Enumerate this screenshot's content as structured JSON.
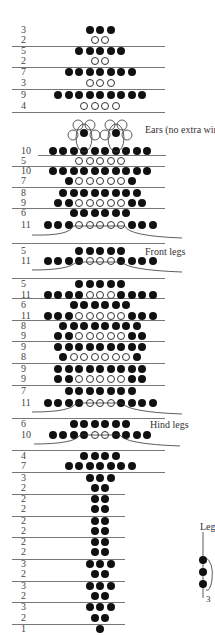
{
  "diagram": {
    "bead_spacing": 10.5,
    "center_x": 100,
    "rows": [
      {
        "label": "3",
        "y": 30,
        "pattern": "FFF"
      },
      {
        "label": "2",
        "y": 40,
        "pattern": "OO"
      },
      {
        "label": "5",
        "y": 51,
        "pattern": "FFFFF"
      },
      {
        "label": "2",
        "y": 61,
        "pattern": "OO"
      },
      {
        "label": "7",
        "y": 72,
        "pattern": "FFFFFFF"
      },
      {
        "label": "3",
        "y": 83,
        "pattern": "OOO"
      },
      {
        "label": "9",
        "y": 95,
        "pattern": "FFFFFFFFF"
      },
      {
        "label": "4",
        "y": 106,
        "pattern": "OOOO"
      },
      {
        "label": "10",
        "y": 151,
        "pattern": "FFFFFFFFFF"
      },
      {
        "label": "5",
        "y": 161,
        "pattern": "OOOOO"
      },
      {
        "label": "10",
        "y": 171,
        "pattern": "FFFFFFFFFF"
      },
      {
        "label": "7",
        "y": 181,
        "pattern": "FOOOOOF"
      },
      {
        "label": "8",
        "y": 193,
        "pattern": "FFFFFFFF"
      },
      {
        "label": "9",
        "y": 203,
        "pattern": "FFOOOOOFF"
      },
      {
        "label": "6",
        "y": 213,
        "pattern": "FFFFFF"
      },
      {
        "label": "11",
        "y": 225,
        "pattern": "FFFOOOOOFFF"
      },
      {
        "label": "5",
        "y": 251,
        "pattern": "FFFFF"
      },
      {
        "label": "11",
        "y": 261,
        "pattern": "FFFFOOOFFFF"
      },
      {
        "label": "5",
        "y": 284,
        "pattern": "FFFFF"
      },
      {
        "label": "11",
        "y": 295,
        "pattern": "FFFFOOOFFFF"
      },
      {
        "label": "6",
        "y": 305,
        "pattern": "FFFFFF"
      },
      {
        "label": "11",
        "y": 316,
        "pattern": "FFFOOOOOFFF"
      },
      {
        "label": "8",
        "y": 326,
        "pattern": "FFFFFFFF"
      },
      {
        "label": "9",
        "y": 336,
        "pattern": "FFOOOOOFF"
      },
      {
        "label": "9",
        "y": 347,
        "pattern": "FFFFFFFFF"
      },
      {
        "label": "8",
        "y": 357,
        "pattern": "FOOOOOOF"
      },
      {
        "label": "9",
        "y": 369,
        "pattern": "FFFFFFFFF"
      },
      {
        "label": "9",
        "y": 379,
        "pattern": "FFOOOOOFF"
      },
      {
        "label": "7",
        "y": 391,
        "pattern": "FFFFFFF"
      },
      {
        "label": "11",
        "y": 403,
        "pattern": "FFFFOOOFFFF"
      },
      {
        "label": "6",
        "y": 424,
        "pattern": "FFFFFF"
      },
      {
        "label": "10",
        "y": 435,
        "pattern": "FFFFOOFFFF"
      },
      {
        "label": "4",
        "y": 456,
        "pattern": "FFFF"
      },
      {
        "label": "7",
        "y": 466,
        "pattern": "FFFFFFF"
      },
      {
        "label": "3",
        "y": 478,
        "pattern": "FFF"
      },
      {
        "label": "2",
        "y": 488,
        "pattern": "FF"
      },
      {
        "label": "2",
        "y": 499,
        "pattern": "FF"
      },
      {
        "label": "2",
        "y": 509,
        "pattern": "FF"
      },
      {
        "label": "2",
        "y": 521,
        "pattern": "FF"
      },
      {
        "label": "2",
        "y": 531,
        "pattern": "FF"
      },
      {
        "label": "2",
        "y": 542,
        "pattern": "FF"
      },
      {
        "label": "2",
        "y": 552,
        "pattern": "FF"
      },
      {
        "label": "3",
        "y": 564,
        "pattern": "FFF"
      },
      {
        "label": "2",
        "y": 574,
        "pattern": "FF"
      },
      {
        "label": "3",
        "y": 586,
        "pattern": "FFF"
      },
      {
        "label": "2",
        "y": 596,
        "pattern": "FF"
      },
      {
        "label": "3",
        "y": 607,
        "pattern": "FFF"
      },
      {
        "label": "2",
        "y": 618,
        "pattern": "FF"
      },
      {
        "label": "1",
        "y": 629,
        "pattern": "F"
      }
    ],
    "separators": [
      {
        "y": 46,
        "x": 12,
        "w": 153
      },
      {
        "y": 67,
        "x": 12,
        "w": 153
      },
      {
        "y": 89,
        "x": 12,
        "w": 153
      },
      {
        "y": 112,
        "x": 12,
        "w": 153
      },
      {
        "y": 155,
        "x": 38,
        "w": 128
      },
      {
        "y": 166,
        "x": 12,
        "w": 153
      },
      {
        "y": 187,
        "x": 12,
        "w": 153
      },
      {
        "y": 208,
        "x": 12,
        "w": 153
      },
      {
        "y": 243,
        "x": 12,
        "w": 153
      },
      {
        "y": 278,
        "x": 12,
        "w": 153
      },
      {
        "y": 298,
        "x": 12,
        "w": 153
      },
      {
        "y": 320,
        "x": 12,
        "w": 153
      },
      {
        "y": 341,
        "x": 12,
        "w": 153
      },
      {
        "y": 363,
        "x": 12,
        "w": 153
      },
      {
        "y": 385,
        "x": 12,
        "w": 153
      },
      {
        "y": 418,
        "x": 12,
        "w": 153
      },
      {
        "y": 450,
        "x": 12,
        "w": 153
      },
      {
        "y": 472,
        "x": 12,
        "w": 153
      },
      {
        "y": 494,
        "x": 12,
        "w": 113
      },
      {
        "y": 516,
        "x": 12,
        "w": 113
      },
      {
        "y": 537,
        "x": 12,
        "w": 113
      },
      {
        "y": 559,
        "x": 12,
        "w": 113
      },
      {
        "y": 581,
        "x": 12,
        "w": 113
      },
      {
        "y": 602,
        "x": 12,
        "w": 113
      },
      {
        "y": 624,
        "x": 12,
        "w": 113
      }
    ],
    "annotations": {
      "ears": "Ears   (no extra wire)",
      "front_legs": "Front legs",
      "hind_legs": "Hind legs",
      "leg_title": "Leg",
      "leg_count": "3"
    },
    "colors": {
      "bead_filled": "#111111",
      "bead_open": "#ffffff",
      "line": "#777777",
      "text": "#444444"
    }
  }
}
